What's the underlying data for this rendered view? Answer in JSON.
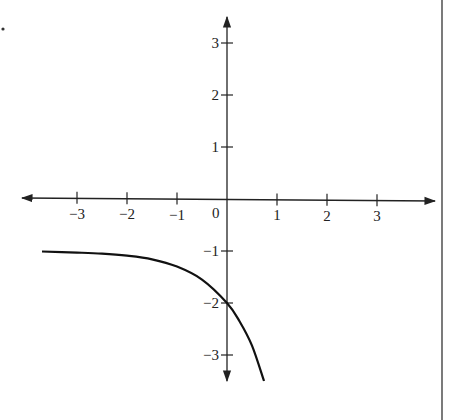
{
  "chart_data": {
    "type": "line",
    "title": "",
    "xlabel": "",
    "ylabel": "",
    "xlim": [
      -3.7,
      4.2
    ],
    "ylim": [
      -3.6,
      3.6
    ],
    "grid": false,
    "legend": null,
    "x_ticks": [
      -3,
      -2,
      -1,
      0,
      1,
      2,
      3
    ],
    "x_tick_labels": [
      "−3",
      "−2",
      "−1",
      "0",
      "1",
      "2",
      "3"
    ],
    "y_ticks": [
      3,
      2,
      1,
      -1,
      -2,
      -3
    ],
    "y_tick_labels": [
      "3",
      "2",
      "1",
      "−1",
      "−2",
      "−3"
    ],
    "origin_label": "0",
    "asymptote": {
      "type": "horizontal",
      "y": -1
    },
    "series": [
      {
        "name": "curve",
        "description": "decreasing exponential-type curve approaching y = -1 as x -> -inf, passing through (0, -2)",
        "x": [
          -3.7,
          -3,
          -2.5,
          -2,
          -1.5,
          -1,
          -0.5,
          0,
          0.25,
          0.5,
          0.74
        ],
        "y": [
          -1.01,
          -1.03,
          -1.05,
          -1.09,
          -1.16,
          -1.3,
          -1.55,
          -2.0,
          -2.35,
          -2.82,
          -3.5
        ]
      }
    ]
  },
  "page": {
    "marker_dot": "•"
  }
}
